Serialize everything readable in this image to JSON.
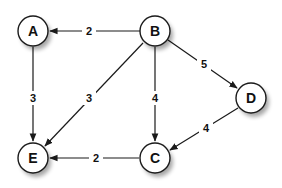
{
  "graph": {
    "type": "directed-weighted",
    "nodes": [
      {
        "id": "A",
        "label": "A",
        "x": 33,
        "y": 31
      },
      {
        "id": "B",
        "label": "B",
        "x": 155,
        "y": 31
      },
      {
        "id": "D",
        "label": "D",
        "x": 251,
        "y": 98
      },
      {
        "id": "C",
        "label": "C",
        "x": 155,
        "y": 158
      },
      {
        "id": "E",
        "label": "E",
        "x": 33,
        "y": 158
      }
    ],
    "edges": [
      {
        "from": "B",
        "to": "A",
        "weight": "2"
      },
      {
        "from": "A",
        "to": "E",
        "weight": "3"
      },
      {
        "from": "B",
        "to": "E",
        "weight": "3"
      },
      {
        "from": "B",
        "to": "C",
        "weight": "4"
      },
      {
        "from": "B",
        "to": "D",
        "weight": "5"
      },
      {
        "from": "D",
        "to": "C",
        "weight": "4"
      },
      {
        "from": "C",
        "to": "E",
        "weight": "2"
      }
    ],
    "colors": {
      "stroke": "#1a1a1a",
      "fill": "#ffffff",
      "text": "#111111"
    }
  }
}
